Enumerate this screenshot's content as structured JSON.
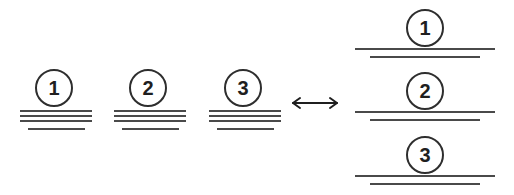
{
  "diagram": {
    "type": "equivalence-diagram",
    "colors": {
      "background": "#ffffff",
      "circle_stroke": "#2e2e2e",
      "digit": "#1f1f1f",
      "rule": "#4a4a4a",
      "arrow": "#1f1f1f"
    },
    "left_group": {
      "name": "stacked-side-by-side-groups",
      "items": [
        {
          "label": "1",
          "circle": {
            "cx": 54,
            "cy": 88,
            "r": 19
          },
          "lines": [
            {
              "x": 20,
              "y": 110,
              "w": 72,
              "h": 2
            },
            {
              "x": 20,
              "y": 115,
              "w": 72,
              "h": 2
            },
            {
              "x": 20,
              "y": 120,
              "w": 72,
              "h": 2
            },
            {
              "x": 28,
              "y": 128,
              "w": 57,
              "h": 2
            }
          ]
        },
        {
          "label": "2",
          "circle": {
            "cx": 148,
            "cy": 88,
            "r": 19
          },
          "lines": [
            {
              "x": 114,
              "y": 110,
              "w": 72,
              "h": 2
            },
            {
              "x": 114,
              "y": 115,
              "w": 72,
              "h": 2
            },
            {
              "x": 114,
              "y": 120,
              "w": 72,
              "h": 2
            },
            {
              "x": 122,
              "y": 128,
              "w": 57,
              "h": 2
            }
          ]
        },
        {
          "label": "3",
          "circle": {
            "cx": 243,
            "cy": 88,
            "r": 19
          },
          "lines": [
            {
              "x": 209,
              "y": 110,
              "w": 72,
              "h": 2
            },
            {
              "x": 209,
              "y": 115,
              "w": 72,
              "h": 2
            },
            {
              "x": 209,
              "y": 120,
              "w": 72,
              "h": 2
            },
            {
              "x": 217,
              "y": 128,
              "w": 57,
              "h": 2
            }
          ]
        }
      ]
    },
    "arrow": {
      "name": "bidirectional-arrow",
      "glyph": "double-headed-horizontal-arrow",
      "x": 291,
      "y": 94,
      "width": 48,
      "height": 18
    },
    "right_group": {
      "name": "vertically-stacked-groups",
      "items": [
        {
          "label": "1",
          "circle": {
            "cx": 425,
            "cy": 28,
            "r": 19
          },
          "lines": [
            {
              "x": 355,
              "y": 48,
              "w": 140,
              "h": 2
            },
            {
              "x": 370,
              "y": 56,
              "w": 110,
              "h": 2
            }
          ]
        },
        {
          "label": "2",
          "circle": {
            "cx": 425,
            "cy": 91,
            "r": 19
          },
          "lines": [
            {
              "x": 355,
              "y": 111,
              "w": 140,
              "h": 2
            },
            {
              "x": 370,
              "y": 119,
              "w": 110,
              "h": 2
            }
          ]
        },
        {
          "label": "3",
          "circle": {
            "cx": 425,
            "cy": 155,
            "r": 19
          },
          "lines": [
            {
              "x": 355,
              "y": 175,
              "w": 140,
              "h": 2
            },
            {
              "x": 370,
              "y": 183,
              "w": 110,
              "h": 2
            }
          ]
        }
      ]
    }
  }
}
